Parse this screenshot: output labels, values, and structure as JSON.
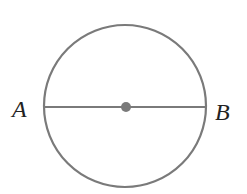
{
  "diagram": {
    "type": "circle-with-diameter",
    "colors": {
      "stroke": "#7a7a7a",
      "center_dot": "#7a7a7a",
      "label": "#222222",
      "background": "#ffffff"
    },
    "circle": {
      "cx": 125,
      "cy": 106,
      "r": 81
    },
    "diameter": {
      "x1": 44,
      "y1": 107,
      "x2": 206,
      "y2": 107
    },
    "center_point": {
      "cx": 126,
      "cy": 107,
      "r": 5
    },
    "labels": [
      {
        "id": "A",
        "text": "A",
        "x": 12,
        "y": 117
      },
      {
        "id": "B",
        "text": "B",
        "x": 215,
        "y": 120
      }
    ]
  }
}
